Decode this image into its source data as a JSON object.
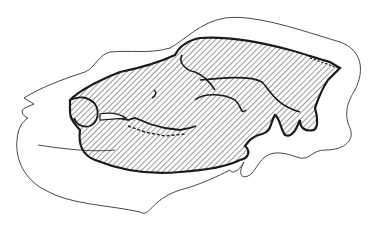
{
  "figure": {
    "colors": {
      "background": "#ffffff",
      "outline": "#333333",
      "skull_stroke": "#1a1a1a",
      "hatch": "#444444"
    }
  }
}
